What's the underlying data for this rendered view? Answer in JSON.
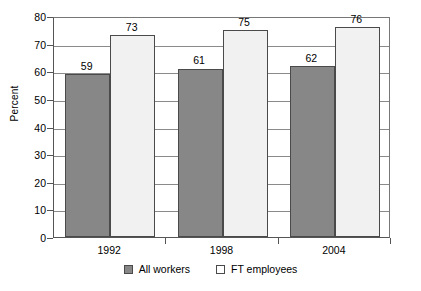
{
  "chart_data": {
    "type": "bar",
    "title": "",
    "subtitle": "",
    "xlabel": "",
    "ylabel": "Percent",
    "categories": [
      "1992",
      "1998",
      "2004"
    ],
    "series": [
      {
        "name": "All workers",
        "values": [
          59,
          61,
          62
        ],
        "color": "#878787"
      },
      {
        "name": "FT employees",
        "values": [
          73,
          75,
          76
        ],
        "color": "#f1f1f1"
      }
    ],
    "ylim": [
      0,
      80
    ],
    "ytick_step": 10,
    "yticks": [
      80,
      70,
      60,
      50,
      40,
      30,
      20,
      10,
      0
    ],
    "grid": true,
    "grid_axis": "y",
    "legend_position": "bottom",
    "data_labels": true,
    "annotations": []
  },
  "legend": {
    "items": [
      {
        "label": "All workers",
        "swatch": "filled-gray-square"
      },
      {
        "label": "FT employees",
        "swatch": "open-white-square"
      }
    ]
  }
}
